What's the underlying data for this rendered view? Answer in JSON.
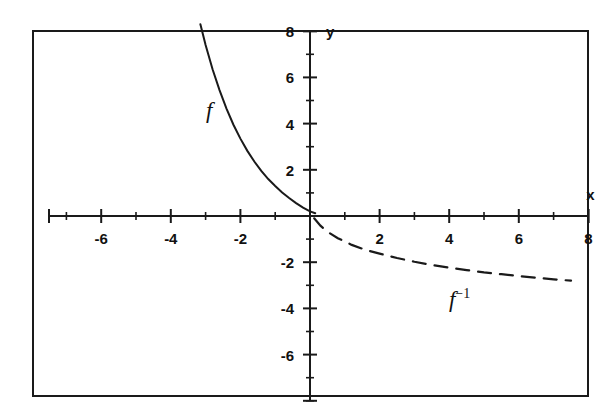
{
  "figure": {
    "background": "#ffffff",
    "frame_color": "#1a1a1a",
    "axis_color": "#1a1a1a"
  },
  "axes": {
    "x_name": "x",
    "y_name": "y",
    "x_labels": [
      "-6",
      "-4",
      "-2",
      "2",
      "4",
      "6",
      "8"
    ],
    "y_labels": [
      "8",
      "6",
      "4",
      "2",
      "-2",
      "-4",
      "-6"
    ]
  },
  "curves": {
    "f_label": "f",
    "finv_label_base": "f",
    "finv_label_exp": "−1"
  },
  "chart_data": {
    "type": "line",
    "title": "",
    "xlabel": "x",
    "ylabel": "y",
    "xlim": [
      -7.5,
      8
    ],
    "ylim": [
      -8,
      8
    ],
    "xticks": [
      -6,
      -4,
      -2,
      2,
      4,
      6,
      8
    ],
    "yticks": [
      8,
      6,
      4,
      2,
      -2,
      -4,
      -6
    ],
    "minor_tick_step_x": 1,
    "minor_tick_step_y": 1,
    "grid": false,
    "legend": "inline-annotations",
    "series": [
      {
        "name": "f",
        "style": "solid",
        "annotation": "f",
        "annotation_xy": [
          -2.9,
          4.6
        ],
        "description": "decaying exponential through quadrant II approaching y=0 from above as x increases",
        "x": [
          -3.15,
          -3.0,
          -2.8,
          -2.6,
          -2.4,
          -2.2,
          -2.0,
          -1.8,
          -1.6,
          -1.4,
          -1.2,
          -1.0,
          -0.8,
          -0.6,
          -0.4,
          -0.2,
          0.0,
          0.15
        ],
        "y": [
          8.3,
          7.4,
          6.35,
          5.45,
          4.65,
          3.95,
          3.35,
          2.82,
          2.36,
          1.95,
          1.6,
          1.3,
          1.02,
          0.78,
          0.56,
          0.36,
          0.2,
          0.12
        ]
      },
      {
        "name": "f-inverse",
        "style": "dashed",
        "annotation": "f−1",
        "annotation_xy": [
          4.3,
          -3.6
        ],
        "description": "reflection of f across the line y=x; negative logarithmic-type curve descending slowly in quadrant IV",
        "x": [
          0.12,
          0.3,
          0.5,
          0.8,
          1.2,
          1.6,
          2.0,
          2.5,
          3.0,
          3.5,
          4.0,
          4.5,
          5.0,
          5.5,
          6.0,
          6.5,
          7.0,
          7.5
        ],
        "y": [
          -0.1,
          -0.42,
          -0.68,
          -0.96,
          -1.25,
          -1.47,
          -1.63,
          -1.82,
          -1.98,
          -2.12,
          -2.24,
          -2.34,
          -2.44,
          -2.52,
          -2.6,
          -2.67,
          -2.74,
          -2.8
        ]
      }
    ]
  }
}
